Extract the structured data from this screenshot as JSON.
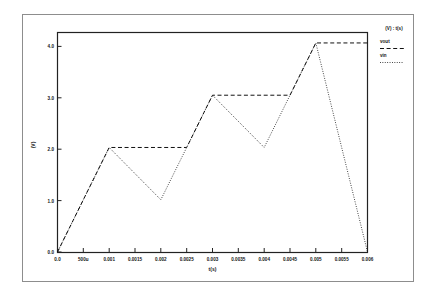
{
  "figure": {
    "border_color": "#8d8d8d",
    "background": "#ffffff"
  },
  "axes": {
    "x_title": "t(s)",
    "y_title": "(V)",
    "x_ticks": [
      "0.0",
      "500u",
      "0.001",
      "0.0015",
      "0.002",
      "0.0025",
      "0.003",
      "0.0035",
      "0.004",
      "0.0045",
      "0.005",
      "0.0055",
      "0.006"
    ],
    "y_ticks": [
      "0.0",
      "1.0",
      "2.0",
      "3.0",
      "4.0"
    ]
  },
  "legend": {
    "header": "(V) : t(s)",
    "entries": [
      {
        "label": "vout",
        "style": "dashed",
        "color": "#111111"
      },
      {
        "label": "vin",
        "style": "dotted",
        "color": "#111111"
      }
    ]
  },
  "chart_data": {
    "type": "line",
    "title": "",
    "subtitle": "",
    "xlabel": "t(s)",
    "ylabel": "(V)",
    "xlim": [
      0.0,
      0.006
    ],
    "ylim": [
      0.0,
      4.2
    ],
    "xticks": [
      0.0,
      0.0005,
      0.001,
      0.0015,
      0.002,
      0.0025,
      0.003,
      0.0035,
      0.004,
      0.0045,
      0.005,
      0.0055,
      0.006
    ],
    "xticklabels": [
      "0.0",
      "500u",
      "0.001",
      "0.0015",
      "0.002",
      "0.0025",
      "0.003",
      "0.0035",
      "0.004",
      "0.0045",
      "0.005",
      "0.0055",
      "0.006"
    ],
    "yticks": [
      0.0,
      1.0,
      2.0,
      3.0,
      4.0
    ],
    "yticklabels": [
      "0.0",
      "1.0",
      "2.0",
      "3.0",
      "4.0"
    ],
    "grid": false,
    "legend_position": "outside-right-top",
    "series": [
      {
        "name": "vin",
        "style": "dotted",
        "color": "#111111",
        "x": [
          0.0,
          0.001,
          0.002,
          0.003,
          0.004,
          0.005,
          0.006
        ],
        "y": [
          0.0,
          2.0,
          1.0,
          3.0,
          2.0,
          4.0,
          0.0
        ]
      },
      {
        "name": "vout",
        "style": "dashed",
        "color": "#111111",
        "x": [
          0.0,
          0.001,
          0.0025,
          0.003,
          0.0045,
          0.005,
          0.006
        ],
        "y": [
          0.0,
          2.0,
          2.0,
          3.0,
          3.0,
          4.0,
          4.0
        ]
      }
    ]
  }
}
